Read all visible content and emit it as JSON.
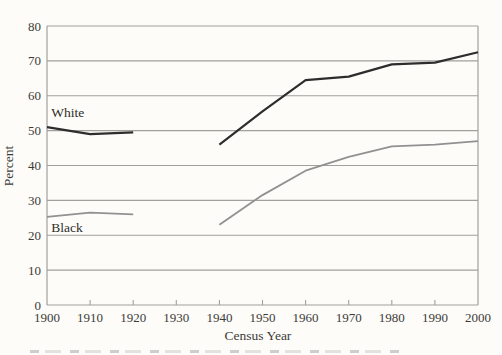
{
  "figure": {
    "background": "#fdfcf9",
    "text_color": "#3c3b38"
  },
  "chart_data": {
    "type": "line",
    "title": "",
    "xlabel": "Census Year",
    "ylabel": "Percent",
    "x": [
      1900,
      1910,
      1920,
      1930,
      1940,
      1950,
      1960,
      1970,
      1980,
      1990,
      2000
    ],
    "xlim": [
      1900,
      2000
    ],
    "ylim": [
      0,
      80
    ],
    "yticks": [
      0,
      10,
      20,
      30,
      40,
      50,
      60,
      70,
      80
    ],
    "grid": "horizontal",
    "plot_border": "box",
    "axis_color": "#a2a09b",
    "legend_position": "inline-labels",
    "series": [
      {
        "name": "White",
        "color": "#2d2d2d",
        "stroke_width": 2.2,
        "values": [
          51,
          49,
          49.5,
          null,
          46,
          55.5,
          64.5,
          65.5,
          69,
          69.5,
          72.5
        ],
        "label_pos": {
          "year": 1901,
          "value": 53.8
        }
      },
      {
        "name": "Black",
        "color": "#919191",
        "stroke_width": 1.8,
        "values": [
          25.3,
          26.5,
          26,
          null,
          23,
          31.5,
          38.5,
          42.5,
          45.5,
          46,
          47
        ],
        "label_pos": {
          "year": 1901,
          "value": 20.9
        }
      }
    ]
  }
}
